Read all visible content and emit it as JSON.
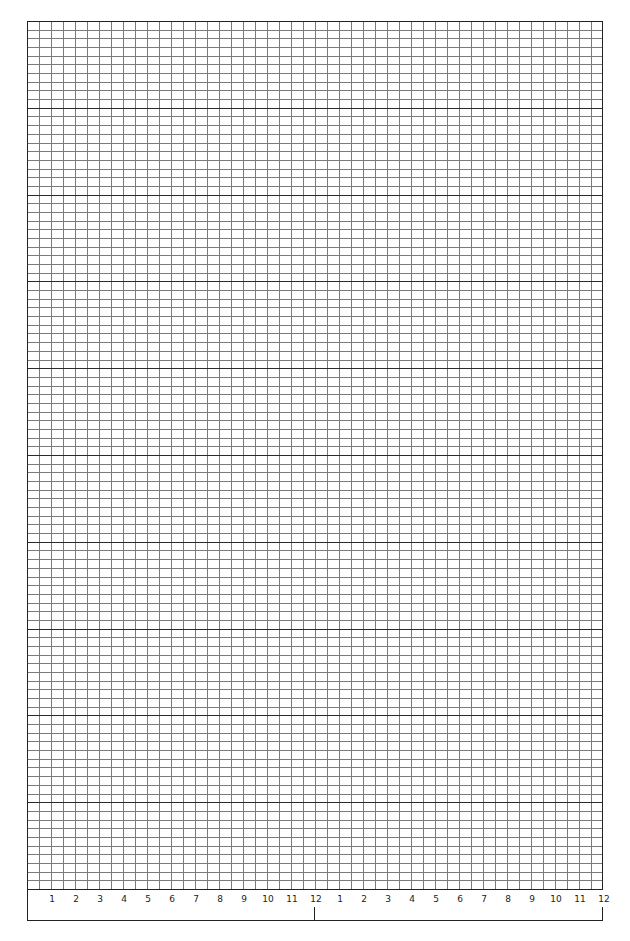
{
  "sheet": {
    "type": "graph-paper",
    "grid": {
      "left": 27,
      "top": 21,
      "right": 603,
      "bottom": 889,
      "columns": 48,
      "rows": 100,
      "major_row_every": 10,
      "minor_color": "#7a7a7a",
      "major_color": "#2a2a2a",
      "border_color": "#222222"
    },
    "label_strip": {
      "bottom": 920,
      "label_y": 894,
      "tick_positions": [
        315,
        603
      ],
      "tick_top": 907
    },
    "x_labels": [
      "1",
      "2",
      "3",
      "4",
      "5",
      "6",
      "7",
      "8",
      "9",
      "10",
      "11",
      "12",
      "1",
      "2",
      "3",
      "4",
      "5",
      "6",
      "7",
      "8",
      "9",
      "10",
      "11",
      "12"
    ]
  }
}
